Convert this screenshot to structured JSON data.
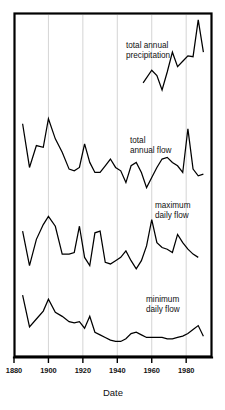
{
  "chart_data": {
    "type": "line",
    "title": "",
    "subtitle": "",
    "xlabel": "Date",
    "ylabel": "",
    "xlim": [
      1880,
      1995
    ],
    "grid": true,
    "legend_position": "inline-annotations",
    "xticks": [
      1880,
      1900,
      1920,
      1940,
      1960,
      1980
    ],
    "xticklabels": [
      "1880",
      "1900",
      "1920",
      "1940",
      "1960",
      "1980"
    ],
    "panels_note": "Four stacked time-series traces sharing one x axis; each trace has its own unlabeled vertical offset scale.",
    "series": [
      {
        "name": "total annual precipitation",
        "label_lines": [
          "total annual",
          "precipitation"
        ],
        "x": [
          1955,
          1960,
          1963,
          1966,
          1969,
          1972,
          1975,
          1978,
          1981,
          1984,
          1987,
          1990
        ],
        "values": [
          28,
          42,
          36,
          20,
          40,
          62,
          46,
          52,
          58,
          57,
          98,
          62
        ],
        "ylim": [
          0,
          100
        ]
      },
      {
        "name": "total annual flow",
        "label_lines": [
          "total",
          "annual flow"
        ],
        "x": [
          1885,
          1889,
          1893,
          1897,
          1900,
          1904,
          1908,
          1912,
          1915,
          1918,
          1921,
          1924,
          1927,
          1930,
          1933,
          1936,
          1939,
          1942,
          1945,
          1948,
          1951,
          1954,
          1957,
          1960,
          1963,
          1966,
          1969,
          1972,
          1975,
          1978,
          1981,
          1984,
          1987,
          1990
        ],
        "values": [
          86,
          34,
          60,
          58,
          92,
          68,
          52,
          32,
          30,
          34,
          62,
          40,
          28,
          28,
          36,
          44,
          34,
          30,
          16,
          36,
          40,
          28,
          10,
          22,
          34,
          44,
          46,
          40,
          36,
          28,
          80,
          32,
          24,
          26
        ],
        "ylim": [
          0,
          100
        ]
      },
      {
        "name": "maximum daily flow",
        "label_lines": [
          "maximum",
          "daily flow"
        ],
        "x": [
          1885,
          1889,
          1893,
          1897,
          1900,
          1904,
          1908,
          1912,
          1915,
          1918,
          1921,
          1924,
          1927,
          1930,
          1933,
          1936,
          1939,
          1942,
          1945,
          1948,
          1951,
          1954,
          1957,
          1960,
          1963,
          1966,
          1969,
          1972,
          1975,
          1978,
          1981,
          1984,
          1987
        ],
        "values": [
          62,
          20,
          52,
          70,
          80,
          68,
          34,
          34,
          36,
          68,
          30,
          20,
          60,
          62,
          24,
          22,
          26,
          30,
          38,
          26,
          16,
          26,
          44,
          76,
          48,
          42,
          40,
          36,
          58,
          48,
          40,
          34,
          30
        ],
        "ylim": [
          0,
          100
        ]
      },
      {
        "name": "minimum daily flow",
        "label_lines": [
          "minimum",
          "daily flow"
        ],
        "x": [
          1885,
          1889,
          1893,
          1897,
          1900,
          1904,
          1908,
          1912,
          1915,
          1918,
          1921,
          1924,
          1927,
          1930,
          1933,
          1936,
          1939,
          1942,
          1945,
          1948,
          1951,
          1954,
          1957,
          1960,
          1963,
          1966,
          1969,
          1972,
          1975,
          1978,
          1981,
          1984,
          1987,
          1990
        ],
        "values": [
          86,
          38,
          50,
          62,
          80,
          60,
          54,
          46,
          44,
          46,
          36,
          54,
          30,
          26,
          22,
          18,
          16,
          16,
          20,
          28,
          30,
          26,
          22,
          22,
          22,
          22,
          20,
          20,
          22,
          24,
          28,
          34,
          40,
          24
        ],
        "ylim": [
          0,
          100
        ]
      }
    ]
  },
  "axis": {
    "x_title": "Date"
  }
}
